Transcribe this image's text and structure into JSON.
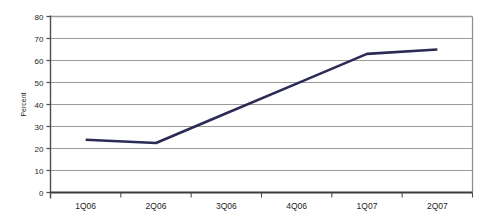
{
  "chart_data": {
    "type": "line",
    "title": "",
    "xlabel": "",
    "ylabel": "Percent",
    "categories": [
      "1Q06",
      "2Q06",
      "3Q06",
      "4Q06",
      "1Q07",
      "2Q07"
    ],
    "values": [
      24,
      22.5,
      36,
      49.5,
      63,
      65
    ],
    "series": [
      {
        "name": "Percent",
        "values": [
          24,
          22.5,
          36,
          49.5,
          63,
          65
        ]
      }
    ],
    "ylim": [
      0,
      80
    ],
    "ytick_values": [
      0,
      10,
      20,
      30,
      40,
      50,
      60,
      70,
      80
    ],
    "ytick_labels": [
      "0",
      "10",
      "20",
      "30",
      "40",
      "50",
      "60",
      "70",
      "80"
    ],
    "grid": true,
    "grid_axis": "y",
    "legend": false,
    "legend_position": "none",
    "markers": false,
    "line_color": "#2b2b55",
    "grid_color": "#9a9a9a",
    "plot_border_color": "#8c8c8c",
    "axis_color": "#4d4d4d",
    "text_color": "#1c1c1c",
    "background_color": "#ffffff"
  }
}
